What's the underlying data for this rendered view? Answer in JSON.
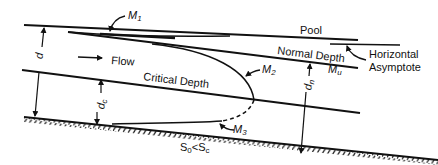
{
  "diagram": {
    "labels": {
      "pool": "Pool",
      "normal_depth": "Normal Depth",
      "critical_depth": "Critical Depth",
      "flow": "Flow",
      "horizontal_asymptote_line1": "Horizontal",
      "horizontal_asymptote_line2": "Asymptote",
      "m1": "M",
      "m1_sub": "1",
      "m2": "M",
      "m2_sub": "2",
      "m3": "M",
      "m3_sub": "3",
      "mn": "M",
      "mn_sub": "u",
      "d": "d",
      "dc": "d",
      "dc_sub": "c",
      "dn": "d",
      "dn_sub": "n",
      "slope_s0": "S",
      "slope_s0_sub": "0",
      "slope_lt": "<",
      "slope_sc": "S",
      "slope_sc_sub": "c"
    },
    "colors": {
      "ink": "#111111",
      "background": "#ffffff"
    }
  }
}
